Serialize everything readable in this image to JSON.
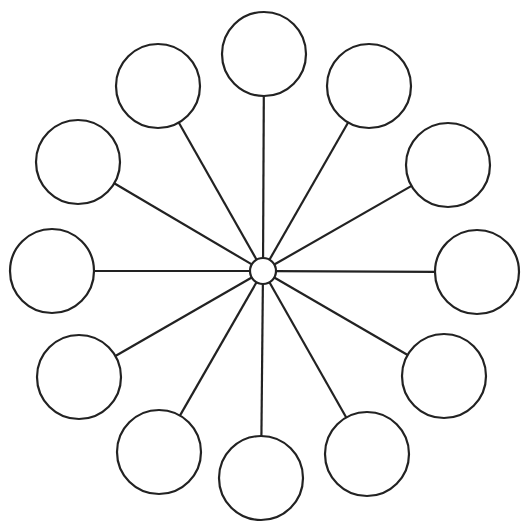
{
  "diagram": {
    "type": "spider-map",
    "background": "#ffffff",
    "stroke_color": "#222222",
    "stroke_width": 2.2,
    "hub": {
      "cx": 263,
      "cy": 271,
      "r": 13
    },
    "node_radius": 42,
    "nodes": [
      {
        "id": "node-top",
        "cx": 264,
        "cy": 54,
        "label": ""
      },
      {
        "id": "node-top-right",
        "cx": 369,
        "cy": 86,
        "label": ""
      },
      {
        "id": "node-right-upper",
        "cx": 448,
        "cy": 165,
        "label": ""
      },
      {
        "id": "node-right",
        "cx": 477,
        "cy": 272,
        "label": ""
      },
      {
        "id": "node-right-lower",
        "cx": 444,
        "cy": 376,
        "label": ""
      },
      {
        "id": "node-bottom-right",
        "cx": 367,
        "cy": 454,
        "label": ""
      },
      {
        "id": "node-bottom",
        "cx": 261,
        "cy": 478,
        "label": ""
      },
      {
        "id": "node-bottom-left",
        "cx": 159,
        "cy": 452,
        "label": ""
      },
      {
        "id": "node-left-lower",
        "cx": 79,
        "cy": 377,
        "label": ""
      },
      {
        "id": "node-left",
        "cx": 52,
        "cy": 271,
        "label": ""
      },
      {
        "id": "node-left-upper",
        "cx": 78,
        "cy": 162,
        "label": ""
      },
      {
        "id": "node-top-left",
        "cx": 158,
        "cy": 86,
        "label": ""
      }
    ]
  }
}
